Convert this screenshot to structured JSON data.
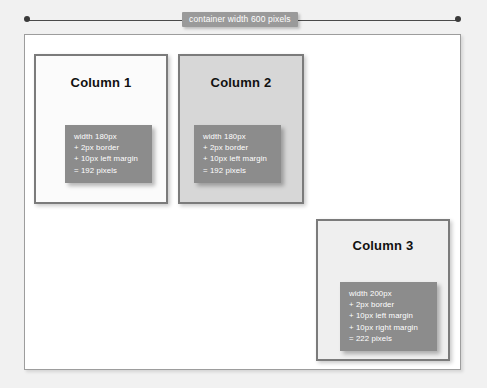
{
  "measure": {
    "label": "container width 600 pixels",
    "endpoint_icon": "dot-endpoint"
  },
  "container": {
    "name": "container",
    "width_px": 600
  },
  "columns": [
    {
      "id": "column-1",
      "title": "Column 1",
      "background": "#fbfbfb",
      "annotation": [
        "width 180px",
        "+ 2px border",
        "+ 10px left margin",
        "= 192 pixels"
      ]
    },
    {
      "id": "column-2",
      "title": "Column 2",
      "background": "#d7d7d7",
      "annotation": [
        "width 180px",
        "+ 2px border",
        "+ 10px left margin",
        "= 192 pixels"
      ]
    },
    {
      "id": "column-3",
      "title": "Column 3",
      "background": "#efefef",
      "annotation": [
        "width 200px",
        "+ 2px border",
        "+ 10px left margin",
        "+ 10px right margin",
        "= 222 pixels"
      ]
    }
  ],
  "colors": {
    "page_background": "#f1f1f1",
    "container_background": "#ffffff",
    "container_border": "#9d9d9d",
    "column_border": "#7b7b7b",
    "annotation_background": "#8c8c8c",
    "annotation_text": "#ffffff",
    "measure_line": "#4a4a4a",
    "measure_label_background": "#9a9a9a",
    "title_text": "#111111"
  }
}
